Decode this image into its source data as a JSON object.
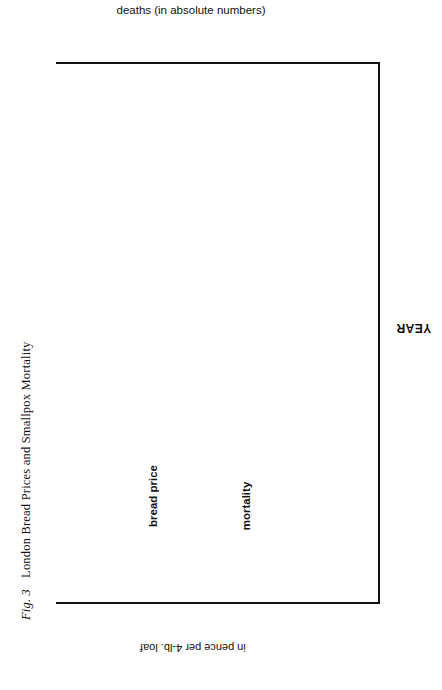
{
  "figure": {
    "number_label": "Fig. 3",
    "caption": "London Bread Prices and Smallpox Mortality"
  },
  "axes": {
    "deaths_title": "deaths (in absolute numbers)",
    "deaths_ticks": [
      "4000",
      "3000",
      "2000",
      "1000",
      "0"
    ],
    "price_title": "in pence per 4-lb. loaf",
    "price_ticks": [
      "10.0",
      "9.0",
      "8.0",
      "7.0",
      "6.0",
      "5.0",
      "4.0",
      "3.0",
      "2.0",
      "1.0"
    ],
    "year_title": "YEAR",
    "year_ticks": [
      "1630",
      "1640",
      "1650",
      "1660",
      "1670",
      "1680",
      "1690",
      "1700",
      "1710",
      "1720",
      "1730"
    ]
  },
  "annotations": {
    "bread_price": "bread price",
    "mortality": "mortality"
  },
  "colors": {
    "ink": "#111111",
    "paper": "#ffffff"
  },
  "chart_data": {
    "type": "line",
    "title": "London Bread Prices and Smallpox Mortality",
    "orientation": "rotated-90-years-vertical",
    "xlabel": "YEAR",
    "ylabel_top": "deaths (in absolute numbers)",
    "ylabel_bottom": "in pence per 4-lb. loaf",
    "grid": false,
    "legend": "inline-annotations",
    "x": [
      1630,
      1631,
      1632,
      1633,
      1634,
      1635,
      1636,
      1637,
      1638,
      1639,
      1640,
      1641,
      1642,
      1643,
      1644,
      1645,
      1646,
      1647,
      1648,
      1649,
      1650,
      1651,
      1652,
      1653,
      1654,
      1655,
      1656,
      1657,
      1658,
      1659,
      1660,
      1661,
      1662,
      1663,
      1664,
      1665,
      1666,
      1667,
      1668,
      1669,
      1670,
      1671,
      1672,
      1673,
      1674,
      1675,
      1676,
      1677,
      1678,
      1679,
      1680,
      1681,
      1682,
      1683,
      1684,
      1685,
      1686,
      1687,
      1688,
      1689,
      1690,
      1691,
      1692,
      1693,
      1694,
      1695,
      1696,
      1697,
      1698,
      1699,
      1700,
      1701,
      1702,
      1703,
      1704,
      1705,
      1706,
      1707,
      1708,
      1709,
      1710,
      1711,
      1712,
      1713,
      1714,
      1715,
      1716,
      1717,
      1718,
      1719,
      1720,
      1721,
      1722,
      1723,
      1724,
      1725,
      1726,
      1727,
      1728,
      1729,
      1730
    ],
    "xlim": [
      1630,
      1730
    ],
    "series": [
      {
        "name": "bread price",
        "style": "solid",
        "unit": "pence per 4-lb. loaf",
        "ylim": [
          1.0,
          10.0
        ],
        "values": [
          5.6,
          7.3,
          5.5,
          6.4,
          5.4,
          6.6,
          5.3,
          6.3,
          7.6,
          5.6,
          5.0,
          5.1,
          4.7,
          4.9,
          4.6,
          6.2,
          6.2,
          7.6,
          9.0,
          7.2,
          5.6,
          5.6,
          5.0,
          4.3,
          4.3,
          4.4,
          4.6,
          5.6,
          6.4,
          6.7,
          6.2,
          7.3,
          8.2,
          6.1,
          5.3,
          5.6,
          5.6,
          5.0,
          4.8,
          5.0,
          5.1,
          5.4,
          5.2,
          5.6,
          6.3,
          6.1,
          5.2,
          5.2,
          5.5,
          5.8,
          5.4,
          5.4,
          5.5,
          5.4,
          5.9,
          5.3,
          4.8,
          4.4,
          4.7,
          5.2,
          5.3,
          5.4,
          5.8,
          6.6,
          7.7,
          7.9,
          7.3,
          7.2,
          6.3,
          5.6,
          5.3,
          5.2,
          5.2,
          5.5,
          5.9,
          5.5,
          5.3,
          5.4,
          6.4,
          8.2,
          8.5,
          7.3,
          6.4,
          5.6,
          5.3,
          5.4,
          5.2,
          5.4,
          5.6,
          5.8,
          5.6,
          5.6,
          5.4,
          5.2,
          5.4,
          5.6,
          5.3,
          5.2,
          5.4,
          5.5,
          5.3
        ]
      },
      {
        "name": "mortality",
        "style": "dashed",
        "unit": "deaths (absolute numbers)",
        "ylim": [
          0,
          4200
        ],
        "values": [
          600,
          480,
          1100,
          550,
          1300,
          400,
          1200,
          500,
          1400,
          450,
          1200,
          400,
          900,
          350,
          800,
          300,
          700,
          450,
          900,
          500,
          1100,
          600,
          1300,
          500,
          1200,
          400,
          1100,
          900,
          1500,
          700,
          1400,
          600,
          1300,
          700,
          1500,
          800,
          1200,
          1000,
          1600,
          900,
          1700,
          1100,
          1900,
          1000,
          1600,
          1200,
          1800,
          1000,
          1700,
          1200,
          1900,
          1100,
          2000,
          1300,
          2100,
          1200,
          1900,
          1400,
          2200,
          1300,
          2000,
          1500,
          2200,
          1600,
          2400,
          1500,
          2300,
          1700,
          2500,
          1600,
          2400,
          1800,
          2600,
          1700,
          2300,
          1900,
          2700,
          1800,
          2600,
          2000,
          3300,
          2100,
          3500,
          2200,
          3000,
          2400,
          3200,
          2300,
          3100,
          2500,
          2900,
          2400,
          3000,
          2600,
          3100,
          2500,
          2900,
          2700,
          3000,
          2600,
          2800
        ]
      }
    ]
  }
}
